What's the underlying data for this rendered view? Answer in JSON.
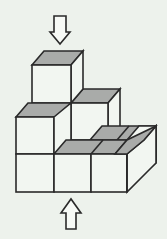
{
  "diagram": {
    "type": "isometric-cube-stack",
    "cube_count_visible": 6,
    "colors": {
      "background": "#edf2ec",
      "stroke": "#2a2a2a",
      "top_face": "#a9aba9",
      "front_face": "#f2f6f1",
      "side_face": "#f2f6f1"
    },
    "arrows": [
      {
        "name": "top-view-arrow",
        "direction": "down",
        "position": "above top cube"
      },
      {
        "name": "front-view-arrow",
        "direction": "up",
        "position": "below bottom row"
      }
    ]
  }
}
